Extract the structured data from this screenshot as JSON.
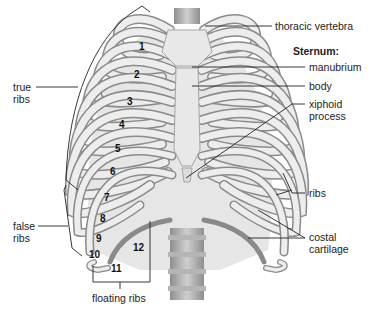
{
  "diagram": {
    "colors": {
      "background": "#ffffff",
      "bone_light": "#ececec",
      "bone_mid": "#d2d2d2",
      "bone_shadow": "#9a9a9a",
      "outline": "#7d7d7d",
      "leader_line": "#222222",
      "text": "#222222"
    },
    "labels_right": {
      "thoracic_vertebra": "thoracic vertebra",
      "sternum_heading": "Sternum:",
      "manubrium": "manubrium",
      "body": "body",
      "xiphoid_line1": "xiphoid",
      "xiphoid_line2": "process",
      "ribs": "ribs",
      "costal_line1": "costal",
      "costal_line2": "cartilage"
    },
    "labels_left": {
      "true_ribs_line1": "true",
      "true_ribs_line2": "ribs",
      "false_ribs_line1": "false",
      "false_ribs_line2": "ribs",
      "floating_ribs": "floating ribs"
    },
    "rib_numbers": [
      "1",
      "2",
      "3",
      "4",
      "5",
      "6",
      "7",
      "8",
      "9",
      "10",
      "11",
      "12"
    ]
  }
}
